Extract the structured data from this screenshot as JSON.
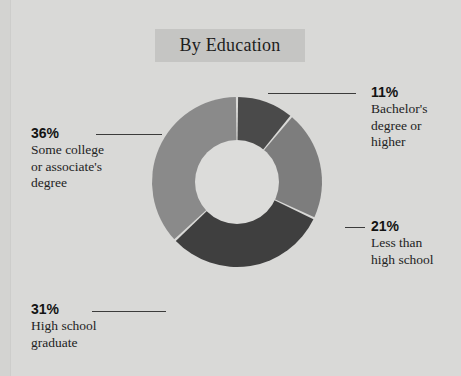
{
  "chart_data": {
    "type": "pie",
    "variant": "donut",
    "title": "By Education",
    "xlabel": "",
    "ylabel": "",
    "legend": "callout-labels",
    "grid": false,
    "unit": "percent",
    "categories": [
      "Bachelor's degree or higher",
      "Less than high school",
      "High school graduate",
      "Some college or associate's degree"
    ],
    "values": [
      11,
      21,
      31,
      36
    ],
    "slices": [
      {
        "label_lines": [
          "Bachelor's",
          "degree or",
          "higher"
        ],
        "value": 11,
        "value_label": "11%",
        "color": "#4a4a4a",
        "start_angle": 0,
        "end_angle": 39.6
      },
      {
        "label_lines": [
          "Less than",
          "high school"
        ],
        "value": 21,
        "value_label": "21%",
        "color": "#7d7d7d",
        "start_angle": 39.6,
        "end_angle": 115.2
      },
      {
        "label_lines": [
          "High school",
          "graduate"
        ],
        "value": 31,
        "value_label": "31%",
        "color": "#3f3f3f",
        "start_angle": 115.2,
        "end_angle": 226.8
      },
      {
        "label_lines": [
          "Some college",
          "or associate's",
          "degree"
        ],
        "value": 36,
        "value_label": "36%",
        "color": "#8a8a8a",
        "start_angle": 226.8,
        "end_angle": 360
      }
    ]
  },
  "callouts": {
    "bachelors": {
      "pct": "11%",
      "line1": "Bachelor's",
      "line2": "degree or",
      "line3": "higher"
    },
    "lessthan": {
      "pct": "21%",
      "line1": "Less than",
      "line2": "high school"
    },
    "highschool": {
      "pct": "31%",
      "line1": "High school",
      "line2": "graduate"
    },
    "somecollege": {
      "pct": "36%",
      "line1": "Some college",
      "line2": "or associate's",
      "line3": "degree"
    }
  },
  "colors": {
    "background": "#d9d9d7",
    "title_band": "#c5c5c3",
    "text": "#1d1d1d",
    "leader_line": "#3b3b3b",
    "slice_dark": "#3f3f3f",
    "slice_darkgray": "#4a4a4a",
    "slice_midgray": "#7d7d7d",
    "slice_lightgray": "#8a8a8a",
    "hole": "#dcdcda"
  }
}
